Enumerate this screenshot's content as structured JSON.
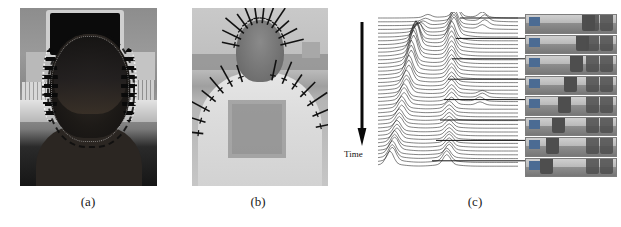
{
  "figure": {
    "type": "multi-panel-scientific-figure",
    "panel_count": 3,
    "background_color": "#ffffff",
    "captions": [
      {
        "id": "caption-a",
        "label": "(a)",
        "center_x": 88
      },
      {
        "id": "caption-b",
        "label": "(b)",
        "center_x": 258
      },
      {
        "id": "caption-c",
        "label": "(c)",
        "center_x": 475
      }
    ]
  },
  "panel_a": {
    "caption": "(a)",
    "description": "Grayscale photograph of the back of a person's head wearing a sensor cap, tracked contour points outlined around the head, CRT monitor and desktop computer equipment in background",
    "media_type": "grayscale-photograph"
  },
  "panel_b": {
    "caption": "(b)",
    "description": "Grayscale photograph of a person's head and shoulders with measurement normal lines radiating outward from the silhouette contour",
    "media_type": "grayscale-photograph",
    "normals_count": 34
  },
  "panel_c": {
    "caption": "(c)",
    "axis_label": "Time",
    "description": "Stacked waterfall plot of per-frame response traces evolving over time, with leader lines connecting selected traces to video thumbnail frames",
    "thumbnail_count": 8,
    "trace_count": 40
  },
  "chart_data": {
    "type": "line",
    "title": "",
    "subtitle": "",
    "xlabel": "",
    "ylabel": "Time",
    "axis_label_position": "left-vertical-arrow-downward",
    "grid": false,
    "legend": false,
    "layout": "waterfall / stacked offset traces, earliest at top, time increasing downward",
    "x": [
      0,
      1,
      2,
      3,
      4,
      5,
      6,
      7,
      8,
      9,
      10,
      11,
      12,
      13,
      14,
      15,
      16,
      17,
      18,
      19,
      20,
      21,
      22,
      23,
      24,
      25,
      26,
      27,
      28,
      29,
      30,
      31,
      32,
      33,
      34,
      35,
      36,
      37,
      38,
      39,
      40,
      41,
      42,
      43,
      44,
      45,
      46,
      47,
      48,
      49,
      50,
      51,
      52,
      53,
      54,
      55,
      56,
      57,
      58,
      59
    ],
    "trace_offset_step": 4,
    "series": [
      {
        "name": "t01",
        "peaks": [
          {
            "x": 33,
            "h": 10
          },
          {
            "x": 44,
            "h": 5
          },
          {
            "x": 21,
            "h": 3
          }
        ]
      },
      {
        "name": "t02",
        "peaks": [
          {
            "x": 33,
            "h": 12
          },
          {
            "x": 45,
            "h": 6
          },
          {
            "x": 20,
            "h": 3
          }
        ]
      },
      {
        "name": "t03",
        "peaks": [
          {
            "x": 32,
            "h": 14
          },
          {
            "x": 45,
            "h": 5
          },
          {
            "x": 19,
            "h": 4
          }
        ]
      },
      {
        "name": "t04",
        "peaks": [
          {
            "x": 32,
            "h": 15
          },
          {
            "x": 44,
            "h": 4
          },
          {
            "x": 18,
            "h": 6
          }
        ]
      },
      {
        "name": "t05",
        "peaks": [
          {
            "x": 32,
            "h": 16
          },
          {
            "x": 17,
            "h": 9
          }
        ]
      },
      {
        "name": "t06",
        "peaks": [
          {
            "x": 32,
            "h": 17
          },
          {
            "x": 17,
            "h": 13
          }
        ]
      },
      {
        "name": "t07",
        "peaks": [
          {
            "x": 31,
            "h": 17
          },
          {
            "x": 16,
            "h": 17
          }
        ]
      },
      {
        "name": "t08",
        "peaks": [
          {
            "x": 31,
            "h": 16
          },
          {
            "x": 16,
            "h": 20
          }
        ]
      },
      {
        "name": "t09",
        "peaks": [
          {
            "x": 31,
            "h": 15
          },
          {
            "x": 16,
            "h": 22
          }
        ]
      },
      {
        "name": "t10",
        "peaks": [
          {
            "x": 31,
            "h": 14
          },
          {
            "x": 15,
            "h": 23
          }
        ]
      },
      {
        "name": "t11",
        "peaks": [
          {
            "x": 31,
            "h": 13
          },
          {
            "x": 15,
            "h": 22
          }
        ]
      },
      {
        "name": "t12",
        "peaks": [
          {
            "x": 31,
            "h": 12
          },
          {
            "x": 15,
            "h": 21
          }
        ]
      },
      {
        "name": "t13",
        "peaks": [
          {
            "x": 31,
            "h": 12
          },
          {
            "x": 14,
            "h": 20
          }
        ]
      },
      {
        "name": "t14",
        "peaks": [
          {
            "x": 31,
            "h": 11
          },
          {
            "x": 14,
            "h": 19
          }
        ]
      },
      {
        "name": "t15",
        "peaks": [
          {
            "x": 31,
            "h": 11
          },
          {
            "x": 14,
            "h": 18
          }
        ]
      },
      {
        "name": "t16",
        "peaks": [
          {
            "x": 31,
            "h": 10
          },
          {
            "x": 13,
            "h": 17
          }
        ]
      },
      {
        "name": "t17",
        "peaks": [
          {
            "x": 31,
            "h": 10
          },
          {
            "x": 13,
            "h": 16
          }
        ]
      },
      {
        "name": "t18",
        "peaks": [
          {
            "x": 31,
            "h": 9
          },
          {
            "x": 13,
            "h": 15
          }
        ]
      },
      {
        "name": "t19",
        "peaks": [
          {
            "x": 31,
            "h": 9
          },
          {
            "x": 12,
            "h": 14
          }
        ]
      },
      {
        "name": "t20",
        "peaks": [
          {
            "x": 31,
            "h": 9
          },
          {
            "x": 12,
            "h": 13
          }
        ]
      },
      {
        "name": "t21",
        "peaks": [
          {
            "x": 31,
            "h": 8
          },
          {
            "x": 12,
            "h": 13
          },
          {
            "x": 44,
            "h": 3
          }
        ]
      },
      {
        "name": "t22",
        "peaks": [
          {
            "x": 31,
            "h": 8
          },
          {
            "x": 11,
            "h": 12
          },
          {
            "x": 44,
            "h": 4
          }
        ]
      },
      {
        "name": "t23",
        "peaks": [
          {
            "x": 31,
            "h": 8
          },
          {
            "x": 11,
            "h": 12
          },
          {
            "x": 43,
            "h": 4
          }
        ]
      },
      {
        "name": "t24",
        "peaks": [
          {
            "x": 31,
            "h": 7
          },
          {
            "x": 11,
            "h": 11
          },
          {
            "x": 43,
            "h": 3
          }
        ]
      },
      {
        "name": "t25",
        "peaks": [
          {
            "x": 30,
            "h": 7
          },
          {
            "x": 10,
            "h": 11
          }
        ]
      },
      {
        "name": "t26",
        "peaks": [
          {
            "x": 30,
            "h": 7
          },
          {
            "x": 10,
            "h": 11
          }
        ]
      },
      {
        "name": "t27",
        "peaks": [
          {
            "x": 30,
            "h": 7
          },
          {
            "x": 10,
            "h": 10
          }
        ]
      },
      {
        "name": "t28",
        "peaks": [
          {
            "x": 30,
            "h": 7
          },
          {
            "x": 9,
            "h": 10
          }
        ]
      },
      {
        "name": "t29",
        "peaks": [
          {
            "x": 30,
            "h": 7
          },
          {
            "x": 9,
            "h": 10
          }
        ]
      },
      {
        "name": "t30",
        "peaks": [
          {
            "x": 30,
            "h": 7
          },
          {
            "x": 9,
            "h": 10
          }
        ]
      },
      {
        "name": "t31",
        "peaks": [
          {
            "x": 30,
            "h": 7
          },
          {
            "x": 8,
            "h": 10
          }
        ]
      },
      {
        "name": "t32",
        "peaks": [
          {
            "x": 30,
            "h": 7
          },
          {
            "x": 8,
            "h": 10
          }
        ]
      },
      {
        "name": "t33",
        "peaks": [
          {
            "x": 30,
            "h": 7
          },
          {
            "x": 8,
            "h": 10
          }
        ]
      },
      {
        "name": "t34",
        "peaks": [
          {
            "x": 30,
            "h": 8
          },
          {
            "x": 7,
            "h": 11
          }
        ]
      },
      {
        "name": "t35",
        "peaks": [
          {
            "x": 30,
            "h": 8
          },
          {
            "x": 7,
            "h": 11
          }
        ]
      },
      {
        "name": "t36",
        "peaks": [
          {
            "x": 30,
            "h": 8
          },
          {
            "x": 7,
            "h": 12
          }
        ]
      },
      {
        "name": "t37",
        "peaks": [
          {
            "x": 30,
            "h": 9
          },
          {
            "x": 6,
            "h": 12
          }
        ]
      },
      {
        "name": "t38",
        "peaks": [
          {
            "x": 29,
            "h": 9
          },
          {
            "x": 6,
            "h": 12
          }
        ]
      },
      {
        "name": "t39",
        "peaks": [
          {
            "x": 29,
            "h": 10
          },
          {
            "x": 6,
            "h": 13
          }
        ]
      },
      {
        "name": "t40",
        "peaks": [
          {
            "x": 29,
            "h": 10
          },
          {
            "x": 5,
            "h": 13
          }
        ]
      }
    ],
    "annotations": [
      {
        "text": "Time",
        "position": "left",
        "arrow": "downward"
      }
    ],
    "thumbnails": [
      {
        "index": 1,
        "linked_trace": "t01"
      },
      {
        "index": 2,
        "linked_trace": "t06"
      },
      {
        "index": 3,
        "linked_trace": "t11"
      },
      {
        "index": 4,
        "linked_trace": "t16"
      },
      {
        "index": 5,
        "linked_trace": "t21"
      },
      {
        "index": 6,
        "linked_trace": "t26"
      },
      {
        "index": 7,
        "linked_trace": "t32"
      },
      {
        "index": 8,
        "linked_trace": "t39"
      }
    ]
  }
}
